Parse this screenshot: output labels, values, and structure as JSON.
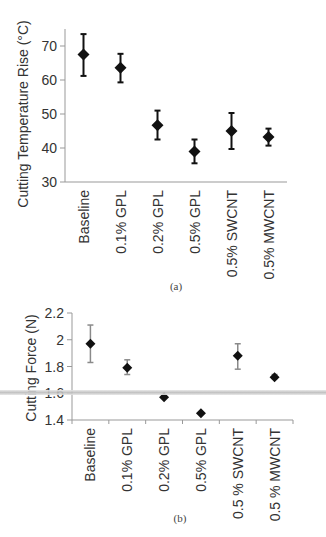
{
  "chart_data": [
    {
      "type": "scatter",
      "panel": "(a)",
      "title": "",
      "xlabel": "",
      "ylabel": "Cutting Temperature Rise (°C)",
      "ylim": [
        30,
        75
      ],
      "yticks": [
        30,
        40,
        50,
        60,
        70
      ],
      "grid": false,
      "legend": null,
      "categories": [
        "Baseline",
        "0.1% GPL",
        "0.2% GPL",
        "0.5% GPL",
        "0.5% SWCNT",
        "0.5% MWCNT"
      ],
      "series": [
        {
          "name": "Cutting Temperature Rise",
          "marker": "diamond",
          "color": "#111111",
          "error_color": "#111111",
          "values": [
            67.5,
            63.6,
            46.7,
            39.0,
            45.0,
            43.2
          ],
          "err_low": [
            61.2,
            59.3,
            42.5,
            35.5,
            39.7,
            40.7
          ],
          "err_high": [
            73.5,
            67.7,
            51.0,
            42.5,
            50.3,
            45.7
          ]
        }
      ],
      "caption": "(a)"
    },
    {
      "type": "scatter",
      "panel": "(b)",
      "title": "",
      "xlabel": "",
      "ylabel": "Cutting Force (N)",
      "ylim": [
        1.4,
        2.2
      ],
      "yticks": [
        1.4,
        1.6,
        1.8,
        2,
        2.2
      ],
      "ytick_labels": [
        "1.4",
        "1.6",
        "1.8",
        "2",
        "2.2"
      ],
      "grid": false,
      "legend": null,
      "categories": [
        "Baseline",
        "0.1% GPL",
        "0.2% GPL",
        "0.5% GPL",
        "0.5 % SWCNT",
        "0.5 % MWCNT"
      ],
      "series": [
        {
          "name": "Cutting Force",
          "marker": "diamond",
          "color": "#111111",
          "error_color": "#8a8a8a",
          "values": [
            1.97,
            1.79,
            1.57,
            1.45,
            1.88,
            1.72
          ],
          "err_low": [
            1.83,
            1.74,
            1.56,
            1.44,
            1.78,
            1.71
          ],
          "err_high": [
            2.11,
            1.85,
            1.58,
            1.46,
            1.97,
            1.74
          ]
        }
      ],
      "caption": "(b)"
    }
  ]
}
